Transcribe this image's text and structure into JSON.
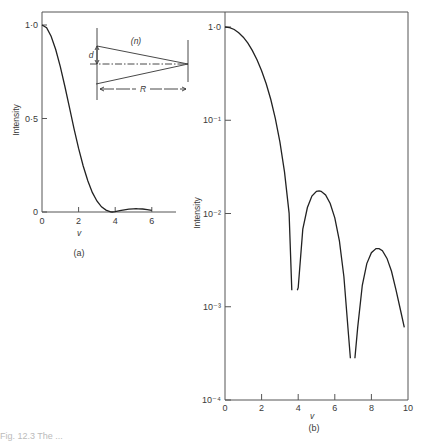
{
  "figure": {
    "panel_a_label": "(a)",
    "panel_b_label": "(b)",
    "inset": {
      "medium_label": "(n)",
      "aperture_label": "d",
      "distance_label": "R"
    },
    "caption_fragment": "Fig. 12.3  The ..."
  },
  "chart_data": [
    {
      "id": "panel-a",
      "type": "line",
      "title": "(a)",
      "xlabel": "v",
      "ylabel": "Intensity",
      "xlim": [
        0,
        7
      ],
      "ylim": [
        0,
        1.0
      ],
      "yscale": "linear",
      "grid": false,
      "x_ticks": [
        0,
        2,
        4,
        6
      ],
      "x_tick_labels": [
        "0",
        "2",
        "4",
        "6"
      ],
      "y_ticks": [
        0,
        0.5,
        1.0
      ],
      "y_tick_labels": [
        "0",
        "0·5",
        "1·0"
      ],
      "series": [
        {
          "name": "Intensity [2J1(v)/v]^2",
          "x": [
            0,
            0.25,
            0.5,
            0.75,
            1.0,
            1.25,
            1.5,
            1.75,
            2.0,
            2.25,
            2.5,
            2.75,
            3.0,
            3.25,
            3.5,
            3.75,
            3.83,
            4.0,
            4.25,
            4.5,
            4.75,
            5.0,
            5.14,
            5.25,
            5.5,
            5.75,
            6.0
          ],
          "y": [
            1.0,
            0.985,
            0.94,
            0.869,
            0.777,
            0.671,
            0.558,
            0.446,
            0.34,
            0.246,
            0.167,
            0.105,
            0.0588,
            0.0279,
            0.0101,
            0.0013,
            0.0,
            0.0016,
            0.0068,
            0.0116,
            0.0154,
            0.0173,
            0.0175,
            0.0173,
            0.0158,
            0.0128,
            0.009
          ]
        }
      ]
    },
    {
      "id": "panel-b",
      "type": "line",
      "title": "(b)",
      "xlabel": "v",
      "ylabel": "Intensity",
      "xlim": [
        0,
        10
      ],
      "ylim": [
        0.0001,
        1.0
      ],
      "yscale": "log",
      "grid": false,
      "x_ticks": [
        0,
        2,
        4,
        6,
        8,
        10
      ],
      "x_tick_labels": [
        "0",
        "2",
        "4",
        "6",
        "8",
        "10"
      ],
      "y_ticks": [
        1.0,
        0.1,
        0.01,
        0.001,
        0.0001
      ],
      "y_tick_labels": [
        "1·0",
        "10⁻¹",
        "10⁻²",
        "10⁻³",
        "10⁻⁴"
      ],
      "series": [
        {
          "name": "main-lobe",
          "x": [
            0,
            0.25,
            0.5,
            0.75,
            1.0,
            1.25,
            1.5,
            1.75,
            2.0,
            2.25,
            2.5,
            2.75,
            3.0,
            3.25,
            3.5,
            3.65
          ],
          "y": [
            1.0,
            0.985,
            0.94,
            0.869,
            0.777,
            0.671,
            0.558,
            0.446,
            0.34,
            0.246,
            0.167,
            0.105,
            0.0588,
            0.0279,
            0.0101,
            0.0015
          ]
        },
        {
          "name": "first-side-lobe",
          "x": [
            3.95,
            4.0,
            4.25,
            4.5,
            4.75,
            5.0,
            5.14,
            5.25,
            5.5,
            5.75,
            6.0,
            6.25,
            6.5,
            6.75,
            6.85
          ],
          "y": [
            0.0015,
            0.0016,
            0.0068,
            0.0116,
            0.0154,
            0.0173,
            0.0175,
            0.0173,
            0.0158,
            0.0128,
            0.009,
            0.0051,
            0.0021,
            0.0005,
            0.00028
          ]
        },
        {
          "name": "second-side-lobe",
          "x": [
            7.1,
            7.25,
            7.5,
            7.75,
            8.0,
            8.25,
            8.42,
            8.6,
            8.85,
            9.1,
            9.35,
            9.6,
            9.8
          ],
          "y": [
            0.00028,
            0.0006,
            0.0017,
            0.0029,
            0.0038,
            0.0042,
            0.0042,
            0.004,
            0.0033,
            0.0024,
            0.0015,
            0.0009,
            0.0006
          ]
        }
      ]
    }
  ]
}
